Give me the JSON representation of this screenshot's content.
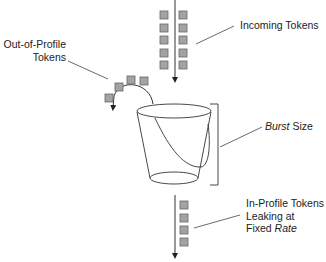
{
  "diagram": {
    "colors": {
      "token_fill": "#a3a3a3",
      "token_stroke": "#666666",
      "line": "#333333",
      "text": "#222222",
      "background": "#ffffff"
    },
    "labels": {
      "incoming": "Incoming Tokens",
      "out_of_profile_line1": "Out-of-Profile",
      "out_of_profile_line2": "Tokens",
      "burst_italic": "Burst",
      "burst_rest": " Size",
      "in_profile_line1": "In-Profile Tokens",
      "in_profile_line2": "Leaking at",
      "in_profile_line3_prefix": "Fixed ",
      "in_profile_line3_italic": "Rate"
    },
    "incoming_tokens": {
      "count": 10,
      "columns": 2,
      "rows": 5
    },
    "out_of_profile_tokens": {
      "count": 4
    },
    "leaking_tokens": {
      "count": 4
    }
  }
}
